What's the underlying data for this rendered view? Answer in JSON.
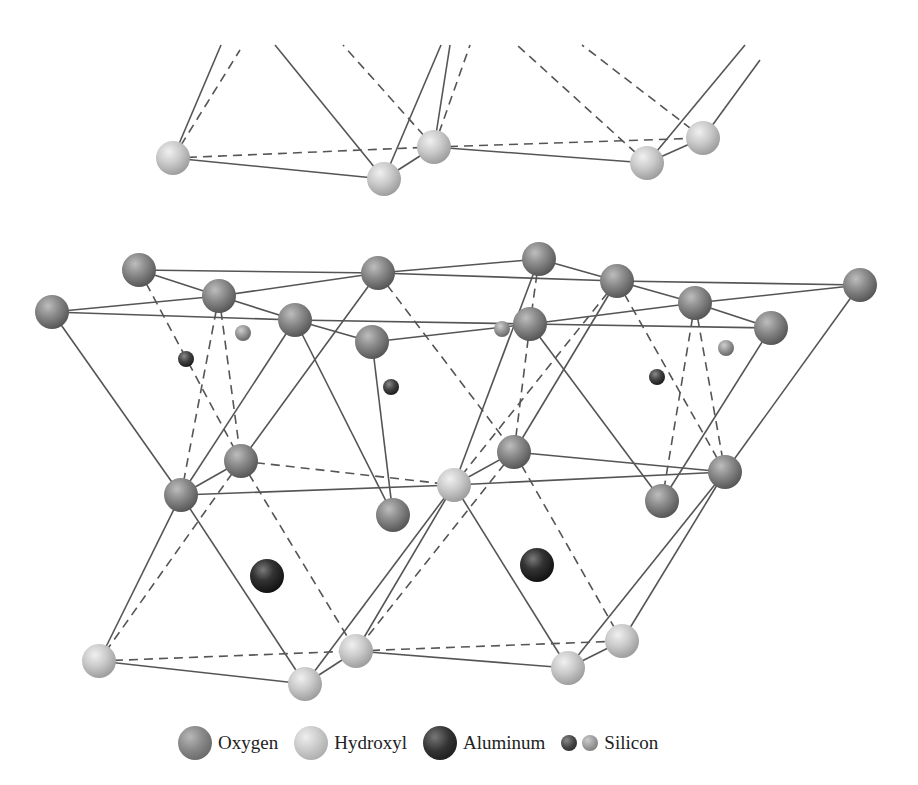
{
  "legend": {
    "items": [
      {
        "key": "oxygen",
        "label": "Oxygen",
        "color": "#8a8a8a"
      },
      {
        "key": "hydroxyl",
        "label": "Hydroxyl",
        "color": "#c8c8c8"
      },
      {
        "key": "aluminum",
        "label": "Aluminum",
        "color": "#222222"
      },
      {
        "key": "silicon",
        "label": "Silicon",
        "color": "#555555"
      }
    ]
  },
  "atoms": [
    {
      "type": "hydroxyl",
      "x": 173,
      "y": 158,
      "r": 17
    },
    {
      "type": "hydroxyl",
      "x": 384,
      "y": 179,
      "r": 17
    },
    {
      "type": "hydroxyl",
      "x": 434,
      "y": 147,
      "r": 17
    },
    {
      "type": "hydroxyl",
      "x": 647,
      "y": 163,
      "r": 17
    },
    {
      "type": "hydroxyl",
      "x": 703,
      "y": 138,
      "r": 17
    },
    {
      "type": "oxygen",
      "x": 139,
      "y": 270,
      "r": 17
    },
    {
      "type": "oxygen",
      "x": 378,
      "y": 273,
      "r": 17
    },
    {
      "type": "oxygen",
      "x": 539,
      "y": 259,
      "r": 17
    },
    {
      "type": "oxygen",
      "x": 617,
      "y": 281,
      "r": 17
    },
    {
      "type": "oxygen",
      "x": 860,
      "y": 285,
      "r": 17
    },
    {
      "type": "oxygen",
      "x": 52,
      "y": 312,
      "r": 17
    },
    {
      "type": "oxygen",
      "x": 219,
      "y": 296,
      "r": 17
    },
    {
      "type": "oxygen",
      "x": 295,
      "y": 320,
      "r": 17
    },
    {
      "type": "oxygen",
      "x": 372,
      "y": 342,
      "r": 17
    },
    {
      "type": "oxygen",
      "x": 530,
      "y": 324,
      "r": 17
    },
    {
      "type": "oxygen",
      "x": 695,
      "y": 303,
      "r": 17
    },
    {
      "type": "oxygen",
      "x": 771,
      "y": 328,
      "r": 17
    },
    {
      "type": "si-dark",
      "x": 186,
      "y": 359,
      "r": 8
    },
    {
      "type": "si-dark",
      "x": 391,
      "y": 387,
      "r": 8
    },
    {
      "type": "si-dark",
      "x": 657,
      "y": 377,
      "r": 8
    },
    {
      "type": "si-light",
      "x": 243,
      "y": 333,
      "r": 8
    },
    {
      "type": "si-light",
      "x": 502,
      "y": 329,
      "r": 8
    },
    {
      "type": "si-light",
      "x": 726,
      "y": 348,
      "r": 8
    },
    {
      "type": "oxygen",
      "x": 241,
      "y": 461,
      "r": 17
    },
    {
      "type": "oxygen",
      "x": 181,
      "y": 495,
      "r": 17
    },
    {
      "type": "oxygen",
      "x": 393,
      "y": 515,
      "r": 17
    },
    {
      "type": "oxygen",
      "x": 514,
      "y": 452,
      "r": 17
    },
    {
      "type": "oxygen",
      "x": 662,
      "y": 501,
      "r": 17
    },
    {
      "type": "oxygen",
      "x": 725,
      "y": 472,
      "r": 17
    },
    {
      "type": "hydroxyl",
      "x": 454,
      "y": 485,
      "r": 17
    },
    {
      "type": "aluminum",
      "x": 267,
      "y": 576,
      "r": 17
    },
    {
      "type": "aluminum",
      "x": 537,
      "y": 565,
      "r": 17
    },
    {
      "type": "hydroxyl",
      "x": 99,
      "y": 661,
      "r": 17
    },
    {
      "type": "hydroxyl",
      "x": 305,
      "y": 684,
      "r": 17
    },
    {
      "type": "hydroxyl",
      "x": 356,
      "y": 651,
      "r": 17
    },
    {
      "type": "hydroxyl",
      "x": 568,
      "y": 668,
      "r": 17
    },
    {
      "type": "hydroxyl",
      "x": 622,
      "y": 641,
      "r": 17
    }
  ],
  "bonds": [
    {
      "x1": 173,
      "y1": 158,
      "x2": 221,
      "y2": 45,
      "d": 0
    },
    {
      "x1": 173,
      "y1": 158,
      "x2": 240,
      "y2": 50,
      "d": 1
    },
    {
      "x1": 384,
      "y1": 179,
      "x2": 275,
      "y2": 45,
      "d": 0
    },
    {
      "x1": 434,
      "y1": 147,
      "x2": 343,
      "y2": 45,
      "d": 1
    },
    {
      "x1": 384,
      "y1": 179,
      "x2": 441,
      "y2": 45,
      "d": 0
    },
    {
      "x1": 434,
      "y1": 147,
      "x2": 450,
      "y2": 45,
      "d": 0
    },
    {
      "x1": 434,
      "y1": 147,
      "x2": 470,
      "y2": 45,
      "d": 1
    },
    {
      "x1": 647,
      "y1": 163,
      "x2": 517,
      "y2": 45,
      "d": 1
    },
    {
      "x1": 703,
      "y1": 138,
      "x2": 582,
      "y2": 45,
      "d": 1
    },
    {
      "x1": 647,
      "y1": 163,
      "x2": 745,
      "y2": 45,
      "d": 0
    },
    {
      "x1": 703,
      "y1": 138,
      "x2": 760,
      "y2": 60,
      "d": 0
    },
    {
      "x1": 173,
      "y1": 158,
      "x2": 434,
      "y2": 147,
      "d": 1
    },
    {
      "x1": 434,
      "y1": 147,
      "x2": 703,
      "y2": 138,
      "d": 1
    },
    {
      "x1": 173,
      "y1": 158,
      "x2": 384,
      "y2": 179,
      "d": 0
    },
    {
      "x1": 384,
      "y1": 179,
      "x2": 434,
      "y2": 147,
      "d": 0
    },
    {
      "x1": 434,
      "y1": 147,
      "x2": 647,
      "y2": 163,
      "d": 0
    },
    {
      "x1": 647,
      "y1": 163,
      "x2": 703,
      "y2": 138,
      "d": 0
    },
    {
      "x1": 139,
      "y1": 270,
      "x2": 378,
      "y2": 273,
      "d": 0
    },
    {
      "x1": 378,
      "y1": 273,
      "x2": 539,
      "y2": 259,
      "d": 0
    },
    {
      "x1": 539,
      "y1": 259,
      "x2": 617,
      "y2": 281,
      "d": 0
    },
    {
      "x1": 378,
      "y1": 273,
      "x2": 617,
      "y2": 281,
      "d": 0
    },
    {
      "x1": 617,
      "y1": 281,
      "x2": 860,
      "y2": 285,
      "d": 0
    },
    {
      "x1": 139,
      "y1": 270,
      "x2": 219,
      "y2": 296,
      "d": 0
    },
    {
      "x1": 52,
      "y1": 312,
      "x2": 219,
      "y2": 296,
      "d": 0
    },
    {
      "x1": 219,
      "y1": 296,
      "x2": 378,
      "y2": 273,
      "d": 0
    },
    {
      "x1": 219,
      "y1": 296,
      "x2": 295,
      "y2": 320,
      "d": 0
    },
    {
      "x1": 52,
      "y1": 312,
      "x2": 295,
      "y2": 320,
      "d": 0
    },
    {
      "x1": 295,
      "y1": 320,
      "x2": 530,
      "y2": 324,
      "d": 0
    },
    {
      "x1": 295,
      "y1": 320,
      "x2": 372,
      "y2": 342,
      "d": 0
    },
    {
      "x1": 372,
      "y1": 342,
      "x2": 530,
      "y2": 324,
      "d": 0
    },
    {
      "x1": 530,
      "y1": 324,
      "x2": 695,
      "y2": 303,
      "d": 0
    },
    {
      "x1": 530,
      "y1": 324,
      "x2": 771,
      "y2": 328,
      "d": 0
    },
    {
      "x1": 617,
      "y1": 281,
      "x2": 695,
      "y2": 303,
      "d": 0
    },
    {
      "x1": 695,
      "y1": 303,
      "x2": 771,
      "y2": 328,
      "d": 0
    },
    {
      "x1": 695,
      "y1": 303,
      "x2": 860,
      "y2": 285,
      "d": 0
    },
    {
      "x1": 539,
      "y1": 259,
      "x2": 530,
      "y2": 324,
      "d": 1
    },
    {
      "x1": 139,
      "y1": 270,
      "x2": 241,
      "y2": 461,
      "d": 1
    },
    {
      "x1": 219,
      "y1": 296,
      "x2": 181,
      "y2": 495,
      "d": 1
    },
    {
      "x1": 219,
      "y1": 296,
      "x2": 241,
      "y2": 461,
      "d": 1
    },
    {
      "x1": 52,
      "y1": 312,
      "x2": 181,
      "y2": 495,
      "d": 0
    },
    {
      "x1": 295,
      "y1": 320,
      "x2": 181,
      "y2": 495,
      "d": 0
    },
    {
      "x1": 378,
      "y1": 273,
      "x2": 241,
      "y2": 461,
      "d": 0
    },
    {
      "x1": 378,
      "y1": 273,
      "x2": 514,
      "y2": 452,
      "d": 1
    },
    {
      "x1": 295,
      "y1": 320,
      "x2": 393,
      "y2": 515,
      "d": 0
    },
    {
      "x1": 372,
      "y1": 342,
      "x2": 393,
      "y2": 515,
      "d": 0
    },
    {
      "x1": 617,
      "y1": 281,
      "x2": 454,
      "y2": 485,
      "d": 1
    },
    {
      "x1": 530,
      "y1": 324,
      "x2": 514,
      "y2": 452,
      "d": 1
    },
    {
      "x1": 617,
      "y1": 281,
      "x2": 514,
      "y2": 452,
      "d": 0
    },
    {
      "x1": 530,
      "y1": 324,
      "x2": 662,
      "y2": 501,
      "d": 0
    },
    {
      "x1": 695,
      "y1": 303,
      "x2": 662,
      "y2": 501,
      "d": 1
    },
    {
      "x1": 695,
      "y1": 303,
      "x2": 725,
      "y2": 472,
      "d": 1
    },
    {
      "x1": 539,
      "y1": 259,
      "x2": 454,
      "y2": 485,
      "d": 0
    },
    {
      "x1": 771,
      "y1": 328,
      "x2": 662,
      "y2": 501,
      "d": 0
    },
    {
      "x1": 860,
      "y1": 285,
      "x2": 725,
      "y2": 472,
      "d": 0
    },
    {
      "x1": 617,
      "y1": 281,
      "x2": 725,
      "y2": 472,
      "d": 1
    },
    {
      "x1": 181,
      "y1": 495,
      "x2": 241,
      "y2": 461,
      "d": 0
    },
    {
      "x1": 181,
      "y1": 495,
      "x2": 454,
      "y2": 485,
      "d": 0
    },
    {
      "x1": 241,
      "y1": 461,
      "x2": 454,
      "y2": 485,
      "d": 1
    },
    {
      "x1": 454,
      "y1": 485,
      "x2": 514,
      "y2": 452,
      "d": 0
    },
    {
      "x1": 454,
      "y1": 485,
      "x2": 725,
      "y2": 472,
      "d": 0
    },
    {
      "x1": 514,
      "y1": 452,
      "x2": 725,
      "y2": 472,
      "d": 0
    },
    {
      "x1": 181,
      "y1": 495,
      "x2": 99,
      "y2": 661,
      "d": 0
    },
    {
      "x1": 241,
      "y1": 461,
      "x2": 99,
      "y2": 661,
      "d": 1
    },
    {
      "x1": 181,
      "y1": 495,
      "x2": 305,
      "y2": 684,
      "d": 0
    },
    {
      "x1": 241,
      "y1": 461,
      "x2": 356,
      "y2": 651,
      "d": 1
    },
    {
      "x1": 454,
      "y1": 485,
      "x2": 305,
      "y2": 684,
      "d": 0
    },
    {
      "x1": 454,
      "y1": 485,
      "x2": 356,
      "y2": 651,
      "d": 0
    },
    {
      "x1": 514,
      "y1": 452,
      "x2": 356,
      "y2": 651,
      "d": 1
    },
    {
      "x1": 454,
      "y1": 485,
      "x2": 568,
      "y2": 668,
      "d": 0
    },
    {
      "x1": 514,
      "y1": 452,
      "x2": 622,
      "y2": 641,
      "d": 1
    },
    {
      "x1": 725,
      "y1": 472,
      "x2": 568,
      "y2": 668,
      "d": 0
    },
    {
      "x1": 725,
      "y1": 472,
      "x2": 622,
      "y2": 641,
      "d": 0
    },
    {
      "x1": 99,
      "y1": 661,
      "x2": 356,
      "y2": 651,
      "d": 1
    },
    {
      "x1": 356,
      "y1": 651,
      "x2": 622,
      "y2": 641,
      "d": 1
    },
    {
      "x1": 99,
      "y1": 661,
      "x2": 305,
      "y2": 684,
      "d": 0
    },
    {
      "x1": 305,
      "y1": 684,
      "x2": 356,
      "y2": 651,
      "d": 0
    },
    {
      "x1": 356,
      "y1": 651,
      "x2": 568,
      "y2": 668,
      "d": 0
    },
    {
      "x1": 568,
      "y1": 668,
      "x2": 622,
      "y2": 641,
      "d": 0
    }
  ]
}
